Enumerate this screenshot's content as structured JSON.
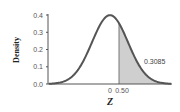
{
  "chart_data": {
    "type": "area",
    "title": "",
    "xlabel": "Z",
    "ylabel": "Density",
    "ylim": [
      0.0,
      0.4
    ],
    "xlim": [
      -3.4,
      3.4
    ],
    "yticks": [
      "0.0",
      "0.1",
      "0.2",
      "0.3",
      "0.4"
    ],
    "xticks": [
      "0",
      "0.50"
    ],
    "grid": false,
    "legend": null,
    "series": [
      {
        "name": "Standard normal density",
        "distribution": "N(0,1)",
        "peak": 0.3989
      }
    ],
    "shaded_region": {
      "from": 0.5,
      "to": "inf",
      "area": 0.3085
    },
    "annotations": [
      "0.3085"
    ]
  },
  "labels": {
    "y_axis": "Density",
    "x_axis": "Z",
    "y_ticks": [
      "0.0",
      "0.1",
      "0.2",
      "0.3",
      "0.4"
    ],
    "x_tick_zero": "0",
    "x_tick_cut": "0.50",
    "area_label": "0.3085"
  },
  "colors": {
    "curve": "#555555",
    "shade": "#cfcfcf",
    "axis": "#555555"
  }
}
